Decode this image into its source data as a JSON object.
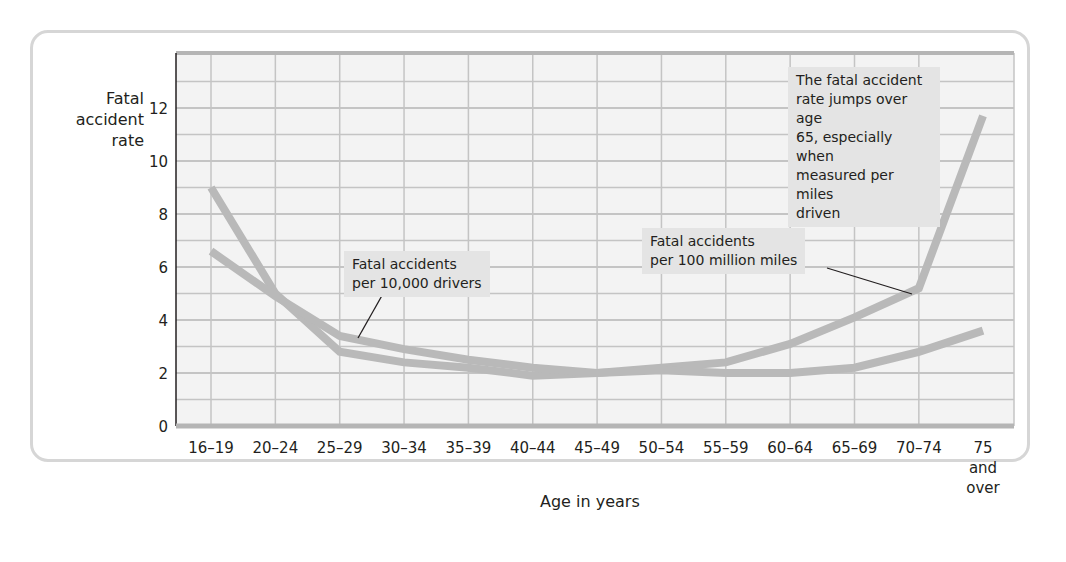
{
  "chart_data": {
    "type": "line",
    "title": "",
    "xlabel": "Age in years",
    "ylabel": "Fatal accident rate",
    "ylim": [
      0,
      14
    ],
    "yticks": [
      0,
      2,
      4,
      6,
      8,
      10,
      12
    ],
    "grid": true,
    "categories": [
      "16–19",
      "20–24",
      "25–29",
      "30–34",
      "35–39",
      "40–44",
      "45–49",
      "50–54",
      "55–59",
      "60–64",
      "65–69",
      "70–74",
      "75 and over"
    ],
    "series": [
      {
        "name": "Fatal accidents per 100 million miles",
        "values": [
          9.0,
          5.0,
          2.8,
          2.4,
          2.2,
          1.9,
          2.0,
          2.2,
          2.4,
          3.1,
          4.1,
          5.2,
          11.7
        ]
      },
      {
        "name": "Fatal accidents per 10,000 drivers",
        "values": [
          6.6,
          4.9,
          3.4,
          2.9,
          2.5,
          2.2,
          2.0,
          2.1,
          2.0,
          2.0,
          2.2,
          2.8,
          3.6
        ]
      }
    ],
    "annotations": [
      "Fatal accidents per 10,000 drivers",
      "Fatal accidents per 100 million miles",
      "The fatal accident rate jumps over age 65, especially when measured per miles driven"
    ],
    "legend": "inline annotations"
  },
  "labels": {
    "ylabel_line1": "Fatal",
    "ylabel_line2": "accident",
    "ylabel_line3": "rate",
    "xlabel": "Age in years",
    "note_drivers_1": "Fatal accidents",
    "note_drivers_2": "per 10,000 drivers",
    "note_miles_1": "Fatal accidents",
    "note_miles_2": "per 100 million miles",
    "note_jump_1": "The fatal accident",
    "note_jump_2": "rate jumps over age",
    "note_jump_3": "65, especially when",
    "note_jump_4": "measured per miles",
    "note_jump_5": "driven",
    "last_cat_1": "75",
    "last_cat_2": "and",
    "last_cat_3": "over"
  },
  "colors": {
    "line": "#b9b9b9",
    "grid": "#c4c4c4",
    "plot_bg": "#f3f3f3",
    "note_bg": "#e4e4e4",
    "text": "#231f20"
  }
}
